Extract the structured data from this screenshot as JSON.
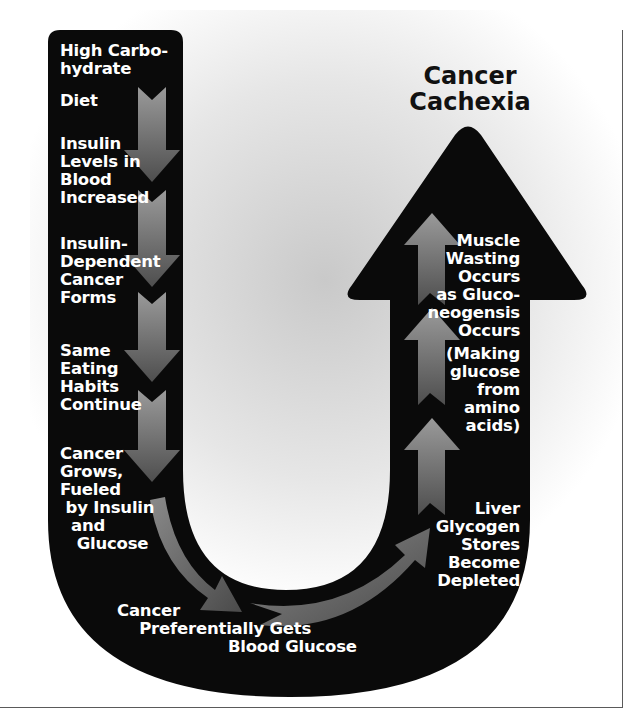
{
  "diagram": {
    "title": "Cancer\nCachexia",
    "colors": {
      "u_shape": "#0a0a0a",
      "arrow_fill_light": "#8c8c8c",
      "arrow_fill_dark": "#4a4a4a",
      "background_center": "#c8c8c8",
      "background_edge": "#ffffff",
      "label_text": "#ffffff",
      "title_text": "#111111"
    },
    "steps": [
      {
        "id": "step1",
        "text": "High Carbo-\nhydrate"
      },
      {
        "id": "step1b",
        "text": "Diet"
      },
      {
        "id": "step2",
        "text": "Insulin\nLevels in\nBlood\nIncreased"
      },
      {
        "id": "step3",
        "text": "Insulin-\nDependent\nCancer\nForms"
      },
      {
        "id": "step4",
        "text": "Same\nEating\nHabits\nContinue"
      },
      {
        "id": "step5",
        "text": "Cancer\nGrows,\nFueled\n by Insulin\n  and\n   Glucose"
      },
      {
        "id": "step6",
        "text": "Cancer\n    Preferentially Gets\n                    Blood Glucose"
      },
      {
        "id": "step7",
        "text": "Liver\nGlycogen\nStores\nBecome\nDepleted"
      },
      {
        "id": "step8",
        "text": "Muscle\nWasting\nOccurs\nas Gluco-\nneogensis\nOccurs"
      },
      {
        "id": "step9",
        "text": "(Making\nglucose\nfrom\namino\nacids)"
      }
    ],
    "flow_direction": "down-left-column, across-bottom, up-right-column",
    "outcome": "Cancer Cachexia"
  }
}
